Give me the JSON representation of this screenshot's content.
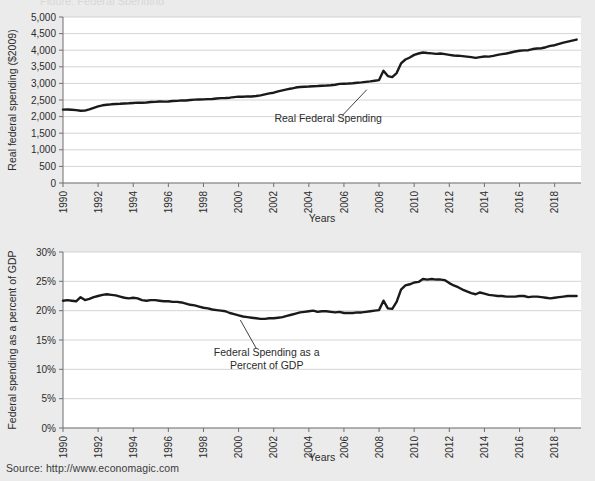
{
  "source_note": "Source: http://www.economagic.com",
  "clipped_title": "Figure: Federal Spending",
  "colors": {
    "page_background": "#ebebeb",
    "plot_background": "#ffffff",
    "line": "#1a1a1a",
    "gridline": "#c9c9c9",
    "axis": "#7a7a7a",
    "text": "#2b2b2b"
  },
  "chart_data": [
    {
      "type": "line",
      "id": "real-federal-spending",
      "title": "",
      "xlabel": "Years",
      "ylabel": "Real federal spending ($2009)",
      "xlim": [
        1990,
        2019.5
      ],
      "ylim": [
        0,
        5000
      ],
      "xticks": [
        1990,
        1992,
        1994,
        1996,
        1998,
        2000,
        2002,
        2004,
        2006,
        2008,
        2010,
        2012,
        2014,
        2016,
        2018
      ],
      "xticklabels": [
        "1990",
        "1992",
        "1994",
        "1996",
        "1998",
        "2000",
        "2002",
        "2004",
        "2006",
        "2008",
        "2010",
        "2012",
        "2014",
        "2016",
        "2018"
      ],
      "yticks": [
        0,
        500,
        1000,
        1500,
        2000,
        2500,
        3000,
        3500,
        4000,
        4500,
        5000
      ],
      "yticklabels": [
        "0",
        "500",
        "1,000",
        "1,500",
        "2,000",
        "2,500",
        "3,000",
        "3,500",
        "4,000",
        "4,500",
        "5,000"
      ],
      "grid": true,
      "legend": "none",
      "annotations": [
        {
          "text": "Real Federal Spending",
          "lines": [
            "Real Federal Spending"
          ],
          "x": 2005.1,
          "y": 1830,
          "leader_from_x": 2005.9,
          "leader_from_y": 2030,
          "leader_to_x": 2007.3,
          "leader_to_y": 2810
        }
      ],
      "series": [
        {
          "name": "Real Federal Spending",
          "x": [
            1990.0,
            1990.25,
            1990.5,
            1990.75,
            1991.0,
            1991.25,
            1991.5,
            1991.75,
            1992.0,
            1992.25,
            1992.5,
            1992.75,
            1993.0,
            1993.25,
            1993.5,
            1993.75,
            1994.0,
            1994.25,
            1994.5,
            1994.75,
            1995.0,
            1995.25,
            1995.5,
            1995.75,
            1996.0,
            1996.25,
            1996.5,
            1996.75,
            1997.0,
            1997.25,
            1997.5,
            1997.75,
            1998.0,
            1998.25,
            1998.5,
            1998.75,
            1999.0,
            1999.25,
            1999.5,
            1999.75,
            2000.0,
            2000.25,
            2000.5,
            2000.75,
            2001.0,
            2001.25,
            2001.5,
            2001.75,
            2002.0,
            2002.25,
            2002.5,
            2002.75,
            2003.0,
            2003.25,
            2003.5,
            2003.75,
            2004.0,
            2004.25,
            2004.5,
            2004.75,
            2005.0,
            2005.25,
            2005.5,
            2005.75,
            2006.0,
            2006.25,
            2006.5,
            2006.75,
            2007.0,
            2007.25,
            2007.5,
            2007.75,
            2008.0,
            2008.25,
            2008.5,
            2008.75,
            2009.0,
            2009.25,
            2009.5,
            2009.75,
            2010.0,
            2010.25,
            2010.5,
            2010.75,
            2011.0,
            2011.25,
            2011.5,
            2011.75,
            2012.0,
            2012.25,
            2012.5,
            2012.75,
            2013.0,
            2013.25,
            2013.5,
            2013.75,
            2014.0,
            2014.25,
            2014.5,
            2014.75,
            2015.0,
            2015.25,
            2015.5,
            2015.75,
            2016.0,
            2016.25,
            2016.5,
            2016.75,
            2017.0,
            2017.25,
            2017.5,
            2017.75,
            2018.0,
            2018.25,
            2018.5,
            2018.75,
            2019.0,
            2019.25
          ],
          "values": [
            2210,
            2215,
            2205,
            2195,
            2175,
            2180,
            2215,
            2265,
            2310,
            2340,
            2355,
            2370,
            2380,
            2385,
            2395,
            2400,
            2410,
            2420,
            2415,
            2425,
            2440,
            2445,
            2455,
            2450,
            2455,
            2470,
            2475,
            2490,
            2485,
            2500,
            2510,
            2515,
            2520,
            2525,
            2530,
            2545,
            2555,
            2560,
            2570,
            2585,
            2600,
            2600,
            2610,
            2605,
            2620,
            2640,
            2670,
            2700,
            2720,
            2760,
            2790,
            2820,
            2845,
            2875,
            2890,
            2900,
            2905,
            2915,
            2920,
            2930,
            2935,
            2945,
            2960,
            2985,
            2990,
            2995,
            3005,
            3020,
            3030,
            3045,
            3060,
            3080,
            3100,
            3380,
            3220,
            3190,
            3310,
            3600,
            3720,
            3780,
            3860,
            3900,
            3930,
            3915,
            3905,
            3890,
            3900,
            3880,
            3860,
            3840,
            3835,
            3820,
            3805,
            3790,
            3770,
            3790,
            3810,
            3805,
            3830,
            3860,
            3880,
            3900,
            3930,
            3960,
            3985,
            3995,
            4000,
            4035,
            4050,
            4060,
            4090,
            4130,
            4150,
            4190,
            4230,
            4260,
            4290,
            4320
          ]
        }
      ]
    },
    {
      "type": "line",
      "id": "federal-spending-percent-gdp",
      "title": "",
      "xlabel": "Years",
      "ylabel": "Federal spending as a percent of GDP",
      "xlim": [
        1990,
        2019.5
      ],
      "ylim": [
        0,
        30
      ],
      "xticks": [
        1990,
        1992,
        1994,
        1996,
        1998,
        2000,
        2002,
        2004,
        2006,
        2008,
        2010,
        2012,
        2014,
        2016,
        2018
      ],
      "xticklabels": [
        "1990",
        "1992",
        "1994",
        "1996",
        "1998",
        "2000",
        "2002",
        "2004",
        "2006",
        "2008",
        "2010",
        "2012",
        "2014",
        "2016",
        "2018"
      ],
      "yticks": [
        0,
        5,
        10,
        15,
        20,
        25,
        30
      ],
      "yticklabels": [
        "0%",
        "5%",
        "10%",
        "15%",
        "20%",
        "25%",
        "30%"
      ],
      "grid": true,
      "legend": "none",
      "annotations": [
        {
          "text": "Federal Spending as a Percent of GDP",
          "lines": [
            "Federal Spending as a",
            "Percent of GDP"
          ],
          "x": 2001.6,
          "y": 12.2,
          "leader_from_x": 2001.0,
          "leader_from_y": 13.6,
          "leader_to_x": 2000.1,
          "leader_to_y": 18.4
        }
      ],
      "series": [
        {
          "name": "Federal Spending as a Percent of GDP",
          "x": [
            1990.0,
            1990.25,
            1990.5,
            1990.75,
            1991.0,
            1991.25,
            1991.5,
            1991.75,
            1992.0,
            1992.25,
            1992.5,
            1992.75,
            1993.0,
            1993.25,
            1993.5,
            1993.75,
            1994.0,
            1994.25,
            1994.5,
            1994.75,
            1995.0,
            1995.25,
            1995.5,
            1995.75,
            1996.0,
            1996.25,
            1996.5,
            1996.75,
            1997.0,
            1997.25,
            1997.5,
            1997.75,
            1998.0,
            1998.25,
            1998.5,
            1998.75,
            1999.0,
            1999.25,
            1999.5,
            1999.75,
            2000.0,
            2000.25,
            2000.5,
            2000.75,
            2001.0,
            2001.25,
            2001.5,
            2001.75,
            2002.0,
            2002.25,
            2002.5,
            2002.75,
            2003.0,
            2003.25,
            2003.5,
            2003.75,
            2004.0,
            2004.25,
            2004.5,
            2004.75,
            2005.0,
            2005.25,
            2005.5,
            2005.75,
            2006.0,
            2006.25,
            2006.5,
            2006.75,
            2007.0,
            2007.25,
            2007.5,
            2007.75,
            2008.0,
            2008.25,
            2008.5,
            2008.75,
            2009.0,
            2009.25,
            2009.5,
            2009.75,
            2010.0,
            2010.25,
            2010.5,
            2010.75,
            2011.0,
            2011.25,
            2011.5,
            2011.75,
            2012.0,
            2012.25,
            2012.5,
            2012.75,
            2013.0,
            2013.25,
            2013.5,
            2013.75,
            2014.0,
            2014.25,
            2014.5,
            2014.75,
            2015.0,
            2015.25,
            2015.5,
            2015.75,
            2016.0,
            2016.25,
            2016.5,
            2016.75,
            2017.0,
            2017.25,
            2017.5,
            2017.75,
            2018.0,
            2018.25,
            2018.5,
            2018.75,
            2019.0,
            2019.25
          ],
          "values": [
            21.7,
            21.8,
            21.7,
            21.6,
            22.3,
            21.8,
            22.0,
            22.3,
            22.5,
            22.7,
            22.8,
            22.7,
            22.6,
            22.4,
            22.2,
            22.1,
            22.2,
            22.1,
            21.8,
            21.7,
            21.8,
            21.8,
            21.7,
            21.6,
            21.6,
            21.5,
            21.5,
            21.4,
            21.2,
            21.0,
            20.9,
            20.7,
            20.5,
            20.4,
            20.2,
            20.1,
            20.0,
            19.9,
            19.6,
            19.4,
            19.2,
            19.0,
            18.9,
            18.8,
            18.7,
            18.6,
            18.6,
            18.7,
            18.7,
            18.8,
            18.9,
            19.1,
            19.3,
            19.5,
            19.7,
            19.8,
            19.9,
            20.0,
            19.8,
            19.9,
            19.9,
            19.8,
            19.7,
            19.8,
            19.6,
            19.6,
            19.6,
            19.7,
            19.7,
            19.8,
            19.9,
            20.0,
            20.1,
            21.7,
            20.4,
            20.3,
            21.5,
            23.6,
            24.3,
            24.5,
            24.8,
            24.9,
            25.4,
            25.3,
            25.4,
            25.3,
            25.3,
            25.2,
            24.7,
            24.3,
            24.0,
            23.6,
            23.3,
            23.0,
            22.8,
            23.1,
            22.9,
            22.7,
            22.6,
            22.5,
            22.5,
            22.4,
            22.4,
            22.4,
            22.5,
            22.5,
            22.3,
            22.4,
            22.4,
            22.3,
            22.2,
            22.1,
            22.2,
            22.3,
            22.4,
            22.5,
            22.5,
            22.5
          ]
        }
      ]
    }
  ]
}
